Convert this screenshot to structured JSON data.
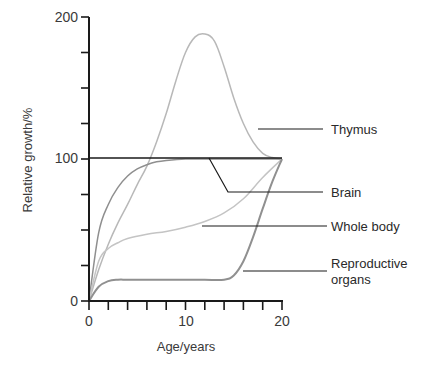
{
  "chart_data": {
    "type": "line",
    "title": "",
    "xlabel": "Age/years",
    "ylabel": "Relative growth/%",
    "xlim": [
      0,
      20
    ],
    "ylim": [
      0,
      200
    ],
    "x_ticks": [
      0,
      2,
      4,
      6,
      8,
      10,
      12,
      14,
      16,
      18,
      20
    ],
    "x_tick_labels": [
      "0",
      "10",
      "20"
    ],
    "y_ticks": [
      0,
      25,
      50,
      75,
      100,
      125,
      150,
      175,
      200
    ],
    "y_tick_labels": [
      "0",
      "100",
      "200"
    ],
    "grid": false,
    "reference_line": {
      "y": 100,
      "label": "100"
    },
    "legend_position": "right (leader-line labels)",
    "series": [
      {
        "name": "Thymus",
        "color": "#b8b8b8",
        "x": [
          0,
          1,
          2,
          3,
          4,
          5,
          6,
          7,
          8,
          9,
          10,
          11,
          12,
          13,
          14,
          15,
          16,
          17,
          18,
          19,
          20
        ],
        "values": [
          0,
          22,
          40,
          55,
          68,
          82,
          95,
          112,
          132,
          155,
          175,
          186,
          188,
          183,
          165,
          143,
          125,
          112,
          104,
          101,
          100
        ]
      },
      {
        "name": "Brain",
        "color": "#8f8f8f",
        "x": [
          0,
          1,
          2,
          3,
          4,
          5,
          6,
          7,
          8,
          10,
          12,
          14,
          16,
          18,
          20
        ],
        "values": [
          0,
          48,
          68,
          80,
          88,
          93,
          96,
          98,
          99,
          100,
          100,
          100,
          100,
          100,
          100
        ]
      },
      {
        "name": "Whole body",
        "color": "#c4c4c4",
        "x": [
          0,
          1,
          2,
          3,
          4,
          6,
          8,
          10,
          12,
          14,
          16,
          18,
          20
        ],
        "values": [
          0,
          28,
          37,
          41,
          44,
          47,
          49,
          52,
          56,
          62,
          72,
          87,
          100
        ]
      },
      {
        "name": "Reproductive organs",
        "color": "#909090",
        "x": [
          0,
          1,
          2,
          3,
          4,
          6,
          8,
          10,
          12,
          14,
          15,
          16,
          17,
          18,
          19,
          20
        ],
        "values": [
          0,
          10,
          14,
          15,
          15,
          15,
          15,
          15,
          15,
          15,
          18,
          28,
          45,
          65,
          84,
          100
        ]
      }
    ]
  },
  "axes": {
    "x_label": "Age/years",
    "y_label": "Relative growth/%",
    "x_tick_labels": [
      "0",
      "10",
      "20"
    ],
    "y_tick_labels": [
      "0",
      "100",
      "200"
    ]
  },
  "legend": {
    "thymus": "Thymus",
    "brain": "Brain",
    "whole_body": "Whole body",
    "reproductive_line1": "Reproductive",
    "reproductive_line2": "organs"
  }
}
